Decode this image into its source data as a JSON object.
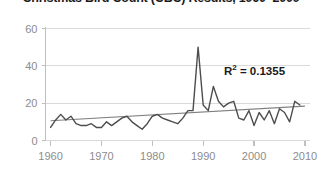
{
  "chart_data": {
    "type": "line",
    "title": "Christmas Bird Count (CBC) Results, 1960–2009",
    "xlabel": "",
    "ylabel": "",
    "xlim": [
      1959,
      2011
    ],
    "ylim": [
      0,
      60
    ],
    "yticks": [
      0,
      20,
      40,
      60
    ],
    "xticks": [
      1960,
      1970,
      1980,
      1990,
      2000,
      2010
    ],
    "grid": true,
    "legend": false,
    "series": [
      {
        "name": "CBC count",
        "color": "#4d4d4d",
        "x": [
          1960,
          1961,
          1962,
          1963,
          1964,
          1965,
          1966,
          1967,
          1968,
          1969,
          1970,
          1971,
          1972,
          1973,
          1974,
          1975,
          1976,
          1977,
          1978,
          1979,
          1980,
          1981,
          1982,
          1983,
          1984,
          1985,
          1986,
          1987,
          1988,
          1989,
          1990,
          1991,
          1992,
          1993,
          1994,
          1995,
          1996,
          1997,
          1998,
          1999,
          2000,
          2001,
          2002,
          2003,
          2004,
          2005,
          2006,
          2007,
          2008,
          2009
        ],
        "values": [
          7,
          11,
          14,
          11,
          13,
          9,
          8,
          8,
          9,
          7,
          7,
          10,
          8,
          10,
          12,
          13,
          10,
          8,
          6,
          9,
          13,
          14,
          12,
          11,
          10,
          9,
          12,
          16,
          16,
          50,
          19,
          16,
          29,
          21,
          18,
          20,
          21,
          12,
          11,
          16,
          8,
          15,
          11,
          16,
          9,
          17,
          15,
          10,
          21,
          19
        ]
      }
    ],
    "trendline": {
      "name": "Linear trend",
      "color": "#808080",
      "x": [
        1960,
        2010
      ],
      "values": [
        10.6,
        18.4
      ]
    },
    "annotations": [
      {
        "name": "r-squared",
        "text_base": "R",
        "text_sup": "2",
        "text_rest": " = 0.1355",
        "full_text": "R² = 0.1355",
        "x_px": 224,
        "y_px": 63
      }
    ],
    "axis_color": "#bfbfbf",
    "grid_color": "#d9d9d9",
    "tick_text_color": "#8c8c8c",
    "background": "#ffffff"
  }
}
